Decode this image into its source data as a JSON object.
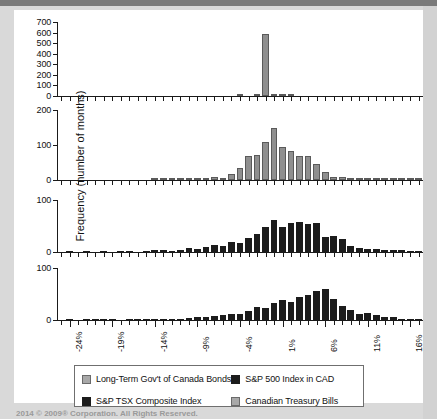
{
  "axes": {
    "ylabel": "Frequency (number of months)",
    "xlabel": "Monthly Return",
    "xticklabels": [
      "-24%",
      "-19%",
      "-14%",
      "-9%",
      "-4%",
      "1%",
      "6%",
      "11%",
      "16%"
    ]
  },
  "legend": {
    "items": [
      {
        "label": "Long-Term Gov't of Canada Bonds",
        "swatch": "grey"
      },
      {
        "label": "S&P 500 Index in CAD",
        "swatch": "dark"
      },
      {
        "label": "S&P TSX Composite Index",
        "swatch": "dark"
      },
      {
        "label": "Canadian Treasury Bills",
        "swatch": "grey"
      }
    ]
  },
  "footer": {
    "text": "2014 © 2009® Corporation. All Rights Reserved."
  },
  "colors": {
    "bar_grey": "#8f8f8f",
    "bar_dark": "#1c1c1c",
    "axis": "#1a1a1a",
    "page_background": "#d9d9d9",
    "figure_background": "#ffffff"
  },
  "chart_data": [
    {
      "type": "bar",
      "title": "Canadian Treasury Bills",
      "panel": 1,
      "xlabel": "Monthly Return",
      "ylabel": "Frequency (number of months)",
      "ylim": [
        0,
        700
      ],
      "yticks": [
        0,
        100,
        200,
        300,
        400,
        500,
        600,
        700
      ],
      "xlim": [
        -25.5,
        17.5
      ],
      "grid": false,
      "bin_width": 1,
      "bin_centers": [
        -25,
        -24,
        -23,
        -22,
        -21,
        -20,
        -19,
        -18,
        -17,
        -16,
        -15,
        -14,
        -13,
        -12,
        -11,
        -10,
        -9,
        -8,
        -7,
        -6,
        -5,
        -4,
        -3,
        -2,
        -1,
        0,
        1,
        2,
        3,
        4,
        5,
        6,
        7,
        8,
        9,
        10,
        11,
        12,
        13,
        14,
        15,
        16,
        17
      ],
      "values": [
        0,
        0,
        0,
        0,
        0,
        0,
        0,
        0,
        0,
        0,
        0,
        0,
        0,
        0,
        0,
        0,
        0,
        0,
        0,
        0,
        0,
        3,
        0,
        6,
        590,
        22,
        14,
        10,
        0,
        0,
        0,
        0,
        0,
        0,
        0,
        0,
        0,
        0,
        0,
        0,
        0,
        0,
        0
      ]
    },
    {
      "type": "bar",
      "title": "Long-Term Gov't of Canada Bonds",
      "panel": 2,
      "xlabel": "Monthly Return",
      "ylabel": "Frequency (number of months)",
      "ylim": [
        0,
        200
      ],
      "yticks": [
        0,
        100,
        200
      ],
      "xlim": [
        -25.5,
        17.5
      ],
      "grid": false,
      "bin_width": 1,
      "bin_centers": [
        -25,
        -24,
        -23,
        -22,
        -21,
        -20,
        -19,
        -18,
        -17,
        -16,
        -15,
        -14,
        -13,
        -12,
        -11,
        -10,
        -9,
        -8,
        -7,
        -6,
        -5,
        -4,
        -3,
        -2,
        -1,
        0,
        1,
        2,
        3,
        4,
        5,
        6,
        7,
        8,
        9,
        10,
        11,
        12,
        13,
        14,
        15,
        16,
        17
      ],
      "values": [
        0,
        0,
        0,
        0,
        0,
        0,
        0,
        0,
        0,
        0,
        0,
        2,
        3,
        2,
        4,
        5,
        7,
        6,
        9,
        5,
        18,
        33,
        70,
        72,
        108,
        150,
        95,
        82,
        69,
        69,
        46,
        22,
        9,
        8,
        6,
        5,
        4,
        3,
        2,
        1,
        2,
        1,
        3
      ]
    },
    {
      "type": "bar",
      "title": "S&P TSX Composite Index",
      "panel": 3,
      "xlabel": "Monthly Return",
      "ylabel": "Frequency (number of months)",
      "ylim": [
        0,
        100
      ],
      "yticks": [
        0,
        100
      ],
      "xlim": [
        -25.5,
        17.5
      ],
      "grid": false,
      "bin_width": 1,
      "bin_centers": [
        -25,
        -24,
        -23,
        -22,
        -21,
        -20,
        -19,
        -18,
        -17,
        -16,
        -15,
        -14,
        -13,
        -12,
        -11,
        -10,
        -9,
        -8,
        -7,
        -6,
        -5,
        -4,
        -3,
        -2,
        -1,
        0,
        1,
        2,
        3,
        4,
        5,
        6,
        7,
        8,
        9,
        10,
        11,
        12,
        13,
        14,
        15,
        16,
        17
      ],
      "values": [
        0,
        1,
        0,
        1,
        0,
        1,
        0,
        1,
        1,
        0,
        2,
        3,
        4,
        2,
        4,
        7,
        6,
        10,
        13,
        12,
        20,
        18,
        27,
        34,
        48,
        62,
        48,
        55,
        58,
        53,
        55,
        28,
        30,
        25,
        12,
        8,
        6,
        5,
        4,
        4,
        3,
        2,
        2
      ]
    },
    {
      "type": "bar",
      "title": "S&P 500 Index in CAD",
      "panel": 4,
      "xlabel": "Monthly Return",
      "ylabel": "Frequency (number of months)",
      "ylim": [
        0,
        100
      ],
      "yticks": [
        0,
        100
      ],
      "xlim": [
        -25.5,
        17.5
      ],
      "grid": false,
      "bin_width": 1,
      "bin_centers": [
        -25,
        -24,
        -23,
        -22,
        -21,
        -20,
        -19,
        -18,
        -17,
        -16,
        -15,
        -14,
        -13,
        -12,
        -11,
        -10,
        -9,
        -8,
        -7,
        -6,
        -5,
        -4,
        -3,
        -2,
        -1,
        0,
        1,
        2,
        3,
        4,
        5,
        6,
        7,
        8,
        9,
        10,
        11,
        12,
        13,
        14,
        15,
        16,
        17
      ],
      "values": [
        0,
        1,
        0,
        1,
        1,
        1,
        1,
        0,
        1,
        1,
        1,
        1,
        2,
        2,
        2,
        4,
        6,
        5,
        8,
        9,
        12,
        11,
        18,
        25,
        24,
        32,
        38,
        35,
        44,
        49,
        56,
        60,
        40,
        26,
        20,
        12,
        14,
        9,
        5,
        5,
        2,
        2,
        1
      ]
    }
  ]
}
